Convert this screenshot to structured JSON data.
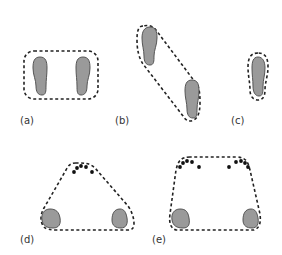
{
  "figure": {
    "panels": [
      {
        "id": "a",
        "label": "(a)",
        "description": "two feet side by side, rectangular dashed boundary"
      },
      {
        "id": "b",
        "label": "(b)",
        "description": "two feet offset diagonally, elongated dashed boundary"
      },
      {
        "id": "c",
        "label": "(c)",
        "description": "single foot, tight dashed boundary"
      },
      {
        "id": "d",
        "label": "(d)",
        "description": "two heels and toe points forming triangular dashed boundary"
      },
      {
        "id": "e",
        "label": "(e)",
        "description": "two heels and two toe clusters forming trapezoidal dashed boundary"
      }
    ],
    "colors": {
      "foot_fill": "#9a9a9a",
      "foot_stroke": "#555555",
      "boundary": "#222222",
      "toe_dot": "#111111",
      "label": "#333333"
    }
  }
}
